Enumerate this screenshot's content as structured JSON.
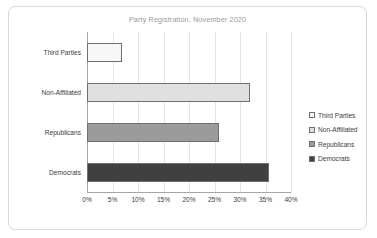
{
  "chart_data": {
    "type": "bar",
    "orientation": "horizontal",
    "title": "Party Registration, November 2020",
    "xlabel": "",
    "ylabel": "",
    "categories": [
      "Third Parties",
      "Non-Affiliated",
      "Republicans",
      "Democrats"
    ],
    "values": [
      6.8,
      32.0,
      25.8,
      35.7
    ],
    "value_suffix": "%",
    "xlim": [
      0,
      40
    ],
    "xticks": [
      0,
      5,
      10,
      15,
      20,
      25,
      30,
      35,
      40
    ],
    "xtick_labels": [
      "0%",
      "5%",
      "10%",
      "15%",
      "20%",
      "25%",
      "30%",
      "35%",
      "40%"
    ],
    "grid": true,
    "grid_axis": "x",
    "legend": [
      "Third Parties",
      "Non-Affiliated",
      "Republicans",
      "Democrats"
    ],
    "legend_position": "right",
    "series_colors": [
      "#f7f7f7",
      "#e0e0e0",
      "#9b9b9b",
      "#404040"
    ],
    "series_border_color": "#6f6f6f"
  },
  "title": {
    "text": "Party Registration, November 2020",
    "color": "#9a9a9a"
  },
  "axis": {
    "line_color": "#a6a6a6",
    "grid_color": "#e3e3e3",
    "tick_labels": [
      "0%",
      "5%",
      "10%",
      "15%",
      "20%",
      "25%",
      "30%",
      "35%",
      "40%"
    ]
  },
  "bars": [
    {
      "label": "Third Parties",
      "value": 6.8,
      "color": "#f7f7f7"
    },
    {
      "label": "Non-Affiliated",
      "value": 32.0,
      "color": "#e0e0e0"
    },
    {
      "label": "Republicans",
      "value": 25.8,
      "color": "#9b9b9b"
    },
    {
      "label": "Democrats",
      "value": 35.7,
      "color": "#404040"
    }
  ],
  "legend": {
    "items": [
      {
        "label": "Third Parties",
        "color": "#f7f7f7"
      },
      {
        "label": "Non-Affiliated",
        "color": "#e0e0e0"
      },
      {
        "label": "Republicans",
        "color": "#9b9b9b"
      },
      {
        "label": "Democrats",
        "color": "#404040"
      }
    ]
  },
  "frame": {
    "border_color": "#d8d8d8"
  }
}
